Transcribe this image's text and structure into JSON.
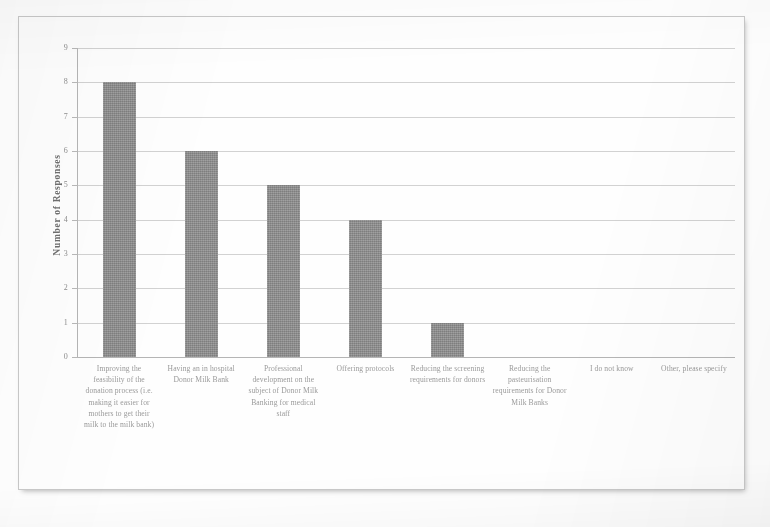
{
  "chart_data": {
    "type": "bar",
    "title": "",
    "xlabel": "",
    "ylabel": "Number of Responses",
    "ylim": [
      0,
      9
    ],
    "yticks": [
      0,
      1,
      2,
      3,
      4,
      5,
      6,
      7,
      8,
      9
    ],
    "grid": true,
    "legend": "none",
    "orientation": "vertical",
    "bar_color": "#8a8a8a",
    "categories": [
      "Improving the feasibility of the donation process (i.e. making it easier for mothers to get their milk to the milk bank)",
      "Having an in hospital Donor Milk Bank",
      "Professional development on the subject of Donor Milk Banking for medical staff",
      "Offering protocols",
      "Reducing the screening requirements for donors",
      "Reducing the pasteurisation requirements for Donor Milk Banks",
      "I do not know",
      "Other, please specify"
    ],
    "values": [
      8,
      6,
      5,
      4,
      1,
      0,
      0,
      0
    ]
  },
  "axes": {
    "y_title": "Number of Responses",
    "y_tick_labels": [
      "0",
      "1",
      "2",
      "3",
      "4",
      "5",
      "6",
      "7",
      "8",
      "9"
    ]
  },
  "colors": {
    "bar": "#8a8a8a",
    "gridline": "#d2d2d2",
    "axis": "#b5b5b5",
    "tick_text": "#8e8e8e",
    "category_text": "#9a9a9a",
    "frame": "#c9c9c9",
    "page_background": "#ffffff"
  }
}
